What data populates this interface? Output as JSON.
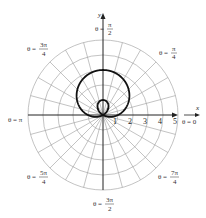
{
  "chart_data": {
    "type": "line",
    "subtype": "polar",
    "title": "",
    "equation": "r = 1 + 2 sin θ",
    "curve_name": "limaçon with inner loop",
    "xlabel": "x",
    "ylabel": "y",
    "radial_ticks": [
      "1",
      "2",
      "3",
      "4",
      "5"
    ],
    "radial_range": [
      0,
      5
    ],
    "angular_grid_step_deg": 15,
    "grid": true,
    "angle_labels": [
      {
        "angle": "0",
        "text": "θ = 0"
      },
      {
        "angle": "π/4",
        "text": "θ = π/4"
      },
      {
        "angle": "π/2",
        "text": "θ = π/2"
      },
      {
        "angle": "3π/4",
        "text": "θ = 3π/4"
      },
      {
        "angle": "π",
        "text": "θ = π"
      },
      {
        "angle": "5π/4",
        "text": "θ = 5π/4"
      },
      {
        "angle": "3π/2",
        "text": "θ = 3π/2"
      },
      {
        "angle": "7π/4",
        "text": "θ = 7π/4"
      }
    ],
    "key_points": [
      {
        "theta": "0",
        "r": 1
      },
      {
        "theta": "π/2",
        "r": 3
      },
      {
        "theta": "π",
        "r": 1
      },
      {
        "theta": "7π/6",
        "r": 0
      },
      {
        "theta": "3π/2",
        "r": -1
      },
      {
        "theta": "11π/6",
        "r": 0
      }
    ]
  },
  "axes": {
    "x_label": "x",
    "y_label": "y"
  },
  "colors": {
    "grid": "#9a9a9a",
    "curve": "#111111",
    "axis": "#222222"
  }
}
